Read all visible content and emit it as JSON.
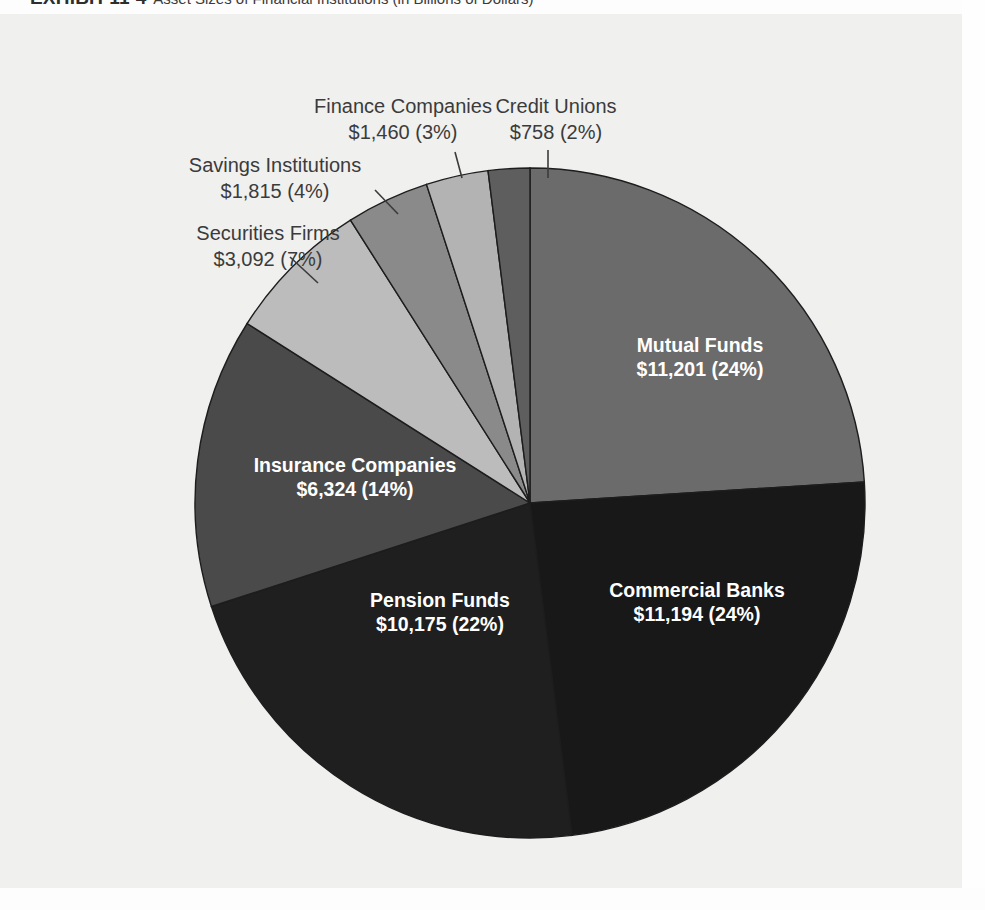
{
  "header": {
    "exhibit_label": "EXHIBIT",
    "exhibit_number": "11-4",
    "caption": "Asset Sizes of Financial Institutions (in Billions of Dollars)"
  },
  "chart_data": {
    "type": "pie",
    "title": "Asset Sizes of Financial Institutions (in Billions of Dollars)",
    "unit": "Billions of Dollars",
    "legend_position": "none",
    "grid": false,
    "start_angle_deg": 0,
    "direction": "clockwise",
    "categories": [
      "Mutual Funds",
      "Commercial Banks",
      "Pension Funds",
      "Insurance Companies",
      "Securities Firms",
      "Savings Institutions",
      "Finance Companies",
      "Credit Unions"
    ],
    "values": [
      11201,
      11194,
      10175,
      6324,
      3092,
      1815,
      1460,
      758
    ],
    "percents": [
      24,
      24,
      22,
      14,
      7,
      4,
      3,
      2
    ],
    "colors": [
      "#6b6b6b",
      "#181818",
      "#1f1f1f",
      "#4a4a4a",
      "#bcbcbc",
      "#8a8a8a",
      "#b3b3b3",
      "#5e5e5e"
    ],
    "slices": [
      {
        "name": "Mutual Funds",
        "value": 11201,
        "percent": 24,
        "color": "#6b6b6b",
        "label_name": "Mutual Funds",
        "label_value": "$11,201 (24%)",
        "label_placement": "inside",
        "label_color": "#ffffff"
      },
      {
        "name": "Commercial Banks",
        "value": 11194,
        "percent": 24,
        "color": "#181818",
        "label_name": "Commercial Banks",
        "label_value": "$11,194 (24%)",
        "label_placement": "inside",
        "label_color": "#ffffff"
      },
      {
        "name": "Pension Funds",
        "value": 10175,
        "percent": 22,
        "color": "#1f1f1f",
        "label_name": "Pension Funds",
        "label_value": "$10,175 (22%)",
        "label_placement": "inside",
        "label_color": "#ffffff"
      },
      {
        "name": "Insurance Companies",
        "value": 6324,
        "percent": 14,
        "color": "#4a4a4a",
        "label_name": "Insurance Companies",
        "label_value": "$6,324 (14%)",
        "label_placement": "inside",
        "label_color": "#ffffff"
      },
      {
        "name": "Securities Firms",
        "value": 3092,
        "percent": 7,
        "color": "#bcbcbc",
        "label_name": "Securities Firms",
        "label_value": "$3,092 (7%)",
        "label_placement": "callout",
        "label_color": "#3b3b3b"
      },
      {
        "name": "Savings Institutions",
        "value": 1815,
        "percent": 4,
        "color": "#8a8a8a",
        "label_name": "Savings Institutions",
        "label_value": "$1,815 (4%)",
        "label_placement": "callout",
        "label_color": "#3b3b3b"
      },
      {
        "name": "Finance Companies",
        "value": 1460,
        "percent": 3,
        "color": "#b3b3b3",
        "label_name": "Finance Companies",
        "label_value": "$1,460 (3%)",
        "label_placement": "callout",
        "label_color": "#3b3b3b"
      },
      {
        "name": "Credit Unions",
        "value": 758,
        "percent": 2,
        "color": "#5e5e5e",
        "label_name": "Credit Unions",
        "label_value": "$758 (2%)",
        "label_placement": "callout",
        "label_color": "#3b3b3b"
      }
    ]
  },
  "geometry": {
    "center_x": 530,
    "center_y": 503,
    "radius": 335
  }
}
